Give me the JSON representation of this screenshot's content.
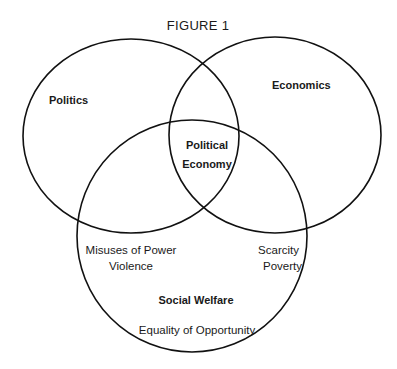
{
  "figure": {
    "title": "FIGURE 1"
  },
  "sets": [
    {
      "id": "politics",
      "label": "Politics",
      "ellipse": {
        "cx": 131,
        "cy": 136,
        "rx": 108,
        "ry": 97
      }
    },
    {
      "id": "economics",
      "label": "Economics",
      "ellipse": {
        "cx": 275,
        "cy": 135,
        "rx": 106,
        "ry": 98
      }
    },
    {
      "id": "social-welfare",
      "label": "Social Welfare",
      "ellipse": {
        "cx": 192,
        "cy": 236,
        "rx": 115,
        "ry": 116
      }
    }
  ],
  "intersection": {
    "line1": "Political",
    "line2": "Economy"
  },
  "regions": {
    "politics_welfare": [
      "Misuses of Power",
      "Violence"
    ],
    "economics_welfare": [
      "Scarcity",
      "Poverty"
    ],
    "welfare_only": [
      "Equality of Opportunity"
    ]
  },
  "colors": {
    "stroke": "#111111",
    "text": "#1a1a1a",
    "background": "#ffffff"
  }
}
